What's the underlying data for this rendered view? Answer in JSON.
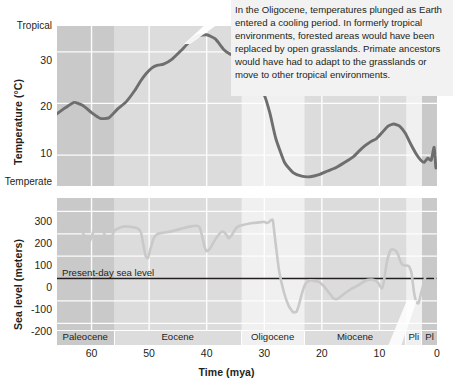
{
  "figure": {
    "annotation": "In the Oligocene, temperatures plunged as Earth entered a cooling period. In formerly tropical environments, forested areas would have been replaced by open grasslands. Primate ancestors would have had to adapt to the grasslands or move to other tropical environments.",
    "xlabel": "Time (mya)",
    "xticks": [
      "60",
      "50",
      "40",
      "30",
      "20",
      "10",
      "0"
    ],
    "xtick_values": [
      60,
      50,
      40,
      30,
      20,
      10,
      0
    ],
    "xlim": [
      66,
      0
    ],
    "epochs": [
      {
        "label": "Paleocene",
        "start": 66,
        "end": 56,
        "shade": "dark"
      },
      {
        "label": "Eocene",
        "start": 56,
        "end": 33.9,
        "shade": "mid"
      },
      {
        "label": "Oligocene",
        "start": 33.9,
        "end": 23,
        "shade": "light"
      },
      {
        "label": "Miocene",
        "start": 23,
        "end": 5.3,
        "shade": "mid"
      },
      {
        "label": "Pli",
        "start": 5.3,
        "end": 2.6,
        "shade": "light"
      },
      {
        "label": "Pl",
        "start": 2.6,
        "end": 0,
        "shade": "dark"
      }
    ],
    "colors": {
      "curve": "#6e6e6e",
      "sea_curve": "#c9c9c9",
      "band_dark": "#c9c9c9",
      "band_mid": "#dcdcdc",
      "band_light": "#f0f0f0",
      "gridline": "#ffffff",
      "zero_line": "#231f20",
      "callout_bg": "#f2f2f2",
      "text": "#231f20"
    }
  },
  "chart_data": [
    {
      "type": "line",
      "id": "temperature",
      "title": "",
      "xlabel": "",
      "ylabel": "Temperature (°C)",
      "ylim": [
        4,
        35
      ],
      "xlim": [
        66,
        0
      ],
      "yticks": [
        10,
        20,
        30
      ],
      "ytick_labels": [
        "10",
        "20",
        "30"
      ],
      "axis_end_labels": {
        "top": "Tropical",
        "bottom": "Temperate"
      },
      "grid": true,
      "legend": "none",
      "x": [
        66,
        64.5,
        63,
        61.5,
        60,
        58.5,
        57,
        55.5,
        54,
        52.5,
        51.5,
        50.5,
        49.5,
        48.5,
        47.5,
        46,
        44.5,
        43,
        41.5,
        40,
        38.5,
        37,
        36,
        35.2,
        34.6,
        34,
        33.4,
        32.8,
        32,
        31,
        30,
        29,
        28,
        26.5,
        25,
        23.5,
        22,
        20.5,
        19,
        17.5,
        16,
        14.5,
        13.5,
        12.5,
        11.5,
        10.5,
        9.5,
        8.5,
        7.5,
        6.5,
        5.5,
        4.5,
        3.5,
        2.8,
        2.2,
        1.6,
        1.0,
        0.5,
        0.2
      ],
      "y": [
        18.0,
        19.2,
        20.2,
        19.6,
        18.2,
        17.1,
        17.2,
        18.9,
        20.3,
        22.5,
        24.3,
        25.8,
        26.9,
        27.4,
        27.6,
        28.6,
        30.2,
        31.9,
        33.1,
        33.3,
        32.5,
        30.4,
        29.6,
        29.3,
        28.8,
        28.3,
        27.6,
        26.5,
        24.6,
        22.3,
        21.6,
        18.0,
        13.2,
        8.6,
        6.6,
        5.9,
        5.8,
        6.2,
        6.9,
        7.6,
        8.6,
        9.7,
        10.8,
        11.8,
        12.6,
        13.2,
        14.4,
        15.6,
        16.0,
        15.6,
        14.2,
        12.0,
        10.0,
        9.0,
        8.6,
        9.4,
        9.0,
        11.5,
        7.5
      ]
    },
    {
      "type": "line",
      "id": "sea_level",
      "title": "",
      "xlabel": "Time (mya)",
      "ylabel": "Sea level (meters)",
      "ylim": [
        -230,
        360
      ],
      "xlim": [
        66,
        0
      ],
      "yticks": [
        300,
        200,
        100,
        0,
        -100,
        -200
      ],
      "ytick_labels": [
        "300",
        "200",
        "100",
        "0",
        "-100",
        "-200"
      ],
      "reference_line": {
        "value": 0,
        "label": "Present-day sea level"
      },
      "grid": true,
      "legend": "none",
      "x": [
        66,
        65,
        64,
        63,
        62,
        61.5,
        61,
        60.5,
        60,
        59.5,
        59,
        58.5,
        58,
        57.5,
        57,
        56.5,
        56,
        55,
        54,
        53,
        52,
        51.4,
        51.0,
        50.6,
        50.2,
        49.8,
        49.2,
        48.5,
        47.5,
        46,
        44.5,
        43,
        41.8,
        41.2,
        40.8,
        40.4,
        40.0,
        39.4,
        38.5,
        37.8,
        37.2,
        36.6,
        36.2,
        35.6,
        35.0,
        34.4,
        33.6,
        32,
        30.5,
        30.0,
        29.6,
        29.2,
        29.0,
        28.8,
        28.5,
        28.0,
        27.4,
        26.6,
        25.8,
        25.0,
        24.4,
        24.0,
        23.6,
        23.2,
        22.8,
        22.4,
        22.0,
        21.4,
        20.6,
        19.8,
        19.0,
        18.4,
        18.0,
        17.6,
        17.2,
        16.8,
        16.2,
        15.6,
        15.0,
        14.4,
        13.8,
        13.2,
        12.6,
        12.0,
        11.4,
        10.8,
        10.2,
        9.6,
        9.2,
        8.8,
        8.4,
        8.0,
        7.6,
        7.2,
        6.8,
        6.4,
        6.0,
        5.6,
        5.2,
        4.8,
        4.4,
        4.0,
        3.6,
        3.2,
        2.8,
        2.4,
        2.0,
        1.6,
        1.2,
        0.8,
        0.4,
        0.0
      ],
      "y": [
        215,
        235,
        245,
        243,
        230,
        205,
        175,
        160,
        185,
        225,
        250,
        245,
        215,
        180,
        165,
        185,
        215,
        228,
        233,
        230,
        224,
        205,
        150,
        100,
        92,
        130,
        180,
        200,
        205,
        212,
        222,
        232,
        236,
        228,
        190,
        145,
        122,
        135,
        175,
        200,
        210,
        196,
        180,
        196,
        222,
        235,
        240,
        248,
        252,
        254,
        248,
        252,
        258,
        262,
        258,
        150,
        30,
        -60,
        -120,
        -150,
        -148,
        -120,
        -80,
        -45,
        -22,
        -12,
        -8,
        -10,
        -14,
        -30,
        -55,
        -75,
        -88,
        -92,
        -90,
        -82,
        -70,
        -58,
        -48,
        -40,
        -32,
        -22,
        -12,
        -6,
        -4,
        -8,
        -20,
        -45,
        -10,
        60,
        105,
        128,
        130,
        125,
        110,
        80,
        62,
        58,
        58,
        52,
        20,
        -60,
        -105,
        -110,
        -70,
        -30,
        10,
        40,
        65,
        62,
        20,
        -50,
        -95,
        -105,
        -85
      ]
    }
  ]
}
